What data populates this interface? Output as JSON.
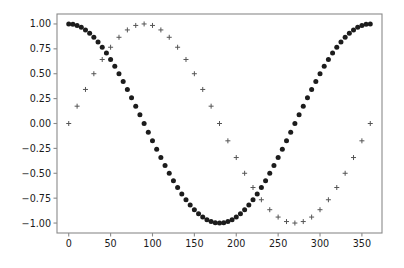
{
  "figure": {
    "background_color": "#ffffff",
    "axes_color": "#8a8a8a",
    "width": 404,
    "height": 268
  },
  "chart_data": {
    "type": "scatter",
    "title": "",
    "xlabel": "",
    "ylabel": "",
    "xlim": [
      -14,
      374
    ],
    "ylim": [
      -1.1,
      1.1
    ],
    "grid": false,
    "legend": null,
    "x_ticks": [
      0,
      50,
      100,
      150,
      200,
      250,
      300,
      350
    ],
    "x_tick_labels": [
      "0",
      "50",
      "100",
      "150",
      "200",
      "250",
      "300",
      "350"
    ],
    "y_ticks": [
      1.0,
      0.75,
      0.5,
      0.25,
      0.0,
      -0.25,
      -0.5,
      -0.75,
      -1.0
    ],
    "y_tick_labels": [
      "1.00",
      "0.75",
      "0.50",
      "0.25",
      "0.00",
      "−0.25",
      "−0.50",
      "−0.75",
      "−1.00"
    ],
    "series": [
      {
        "name": "cos",
        "marker": "filled-circle",
        "color": "#1c1c1c",
        "marker_size": 5.0,
        "x": [
          0,
          5,
          10,
          15,
          20,
          25,
          30,
          35,
          40,
          45,
          50,
          55,
          60,
          65,
          70,
          75,
          80,
          85,
          90,
          95,
          100,
          105,
          110,
          115,
          120,
          125,
          130,
          135,
          140,
          145,
          150,
          155,
          160,
          165,
          170,
          175,
          180,
          185,
          190,
          195,
          200,
          205,
          210,
          215,
          220,
          225,
          230,
          235,
          240,
          245,
          250,
          255,
          260,
          265,
          270,
          275,
          280,
          285,
          290,
          295,
          300,
          305,
          310,
          315,
          320,
          325,
          330,
          335,
          340,
          345,
          350,
          355,
          360
        ],
        "values": [
          1.0,
          0.996,
          0.985,
          0.966,
          0.94,
          0.906,
          0.866,
          0.819,
          0.766,
          0.707,
          0.643,
          0.574,
          0.5,
          0.423,
          0.342,
          0.259,
          0.174,
          0.087,
          0.0,
          -0.087,
          -0.174,
          -0.259,
          -0.342,
          -0.423,
          -0.5,
          -0.574,
          -0.643,
          -0.707,
          -0.766,
          -0.819,
          -0.866,
          -0.906,
          -0.94,
          -0.966,
          -0.985,
          -0.996,
          -1.0,
          -0.996,
          -0.985,
          -0.966,
          -0.94,
          -0.906,
          -0.866,
          -0.819,
          -0.766,
          -0.707,
          -0.643,
          -0.574,
          -0.5,
          -0.423,
          -0.342,
          -0.259,
          -0.174,
          -0.087,
          0.0,
          0.087,
          0.174,
          0.259,
          0.342,
          0.423,
          0.5,
          0.574,
          0.643,
          0.707,
          0.766,
          0.819,
          0.866,
          0.906,
          0.94,
          0.966,
          0.985,
          0.996,
          1.0
        ]
      },
      {
        "name": "sin",
        "marker": "plus",
        "color": "#555555",
        "marker_size": 5.0,
        "x": [
          0,
          10,
          20,
          30,
          40,
          50,
          60,
          70,
          80,
          90,
          100,
          110,
          120,
          130,
          140,
          150,
          160,
          170,
          180,
          190,
          200,
          210,
          220,
          230,
          240,
          250,
          260,
          270,
          280,
          290,
          300,
          310,
          320,
          330,
          340,
          350,
          360
        ],
        "values": [
          0.0,
          0.174,
          0.342,
          0.5,
          0.643,
          0.766,
          0.866,
          0.94,
          0.985,
          1.0,
          0.985,
          0.94,
          0.866,
          0.766,
          0.643,
          0.5,
          0.342,
          0.174,
          0.0,
          -0.174,
          -0.342,
          -0.5,
          -0.643,
          -0.766,
          -0.866,
          -0.94,
          -0.985,
          -1.0,
          -0.985,
          -0.94,
          -0.866,
          -0.766,
          -0.643,
          -0.5,
          -0.342,
          -0.174,
          0.0
        ]
      }
    ]
  }
}
